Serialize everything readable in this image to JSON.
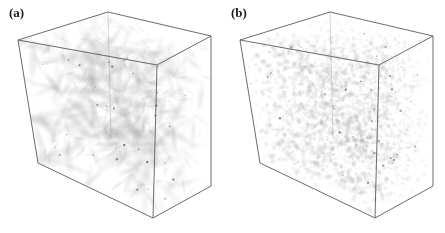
{
  "figure": {
    "background_color": "#ffffff",
    "edge_color": "#5a5a5a",
    "structure_color": "#9a9a9a",
    "width": 445,
    "height": 233,
    "panel_count": 2
  },
  "panels": [
    {
      "id": "panel-a",
      "label": "(a)",
      "offset_x": 0,
      "description": "three-dimensional cube volume rendering of coarse large-scale vortex filament structures",
      "structure_scale": "coarse",
      "grain": "worm-like elongated vortex tubes",
      "seed": 20345,
      "blob_count": 460,
      "blob_radius_min": 2.0,
      "blob_radius_max": 9.5,
      "blob_elongation": 2.6,
      "blob_opacity_min": 0.05,
      "blob_opacity_max": 0.3,
      "speck_count": 34,
      "cube": {
        "top_left": [
          18,
          40
        ],
        "top_back": [
          108,
          12
        ],
        "top_right": [
          211,
          36
        ],
        "top_front": [
          157,
          65
        ],
        "bottom_left": [
          38,
          163
        ],
        "bottom_front": [
          153,
          218
        ],
        "bottom_right": [
          211,
          186
        ],
        "bottom_back": [
          111,
          139
        ]
      }
    },
    {
      "id": "panel-b",
      "label": "(b)",
      "offset_x": 222,
      "description": "three-dimensional cube volume rendering of fine-grained small-scale turbulent structures",
      "structure_scale": "fine",
      "grain": "dense granular speckle of small-scale eddies",
      "seed": 77219,
      "blob_count": 2600,
      "blob_radius_min": 0.8,
      "blob_radius_max": 3.4,
      "blob_elongation": 1.25,
      "blob_opacity_min": 0.05,
      "blob_opacity_max": 0.34,
      "speck_count": 46,
      "cube": {
        "top_left": [
          18,
          40
        ],
        "top_back": [
          108,
          12
        ],
        "top_right": [
          211,
          36
        ],
        "top_front": [
          157,
          65
        ],
        "bottom_left": [
          38,
          163
        ],
        "bottom_front": [
          153,
          218
        ],
        "bottom_right": [
          211,
          186
        ],
        "bottom_back": [
          111,
          139
        ]
      }
    }
  ]
}
